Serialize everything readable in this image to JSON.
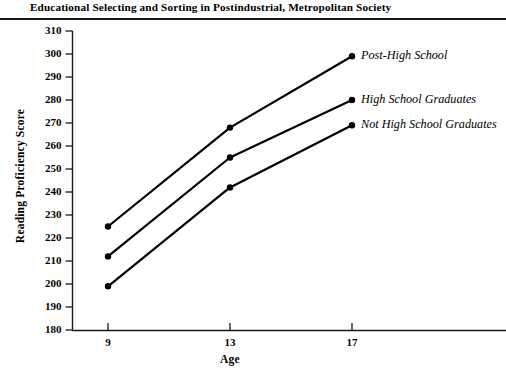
{
  "running_head": {
    "title": "Educational Selecting and Sorting in Postindustrial, Metropolitan Society"
  },
  "chart_data": {
    "type": "line",
    "title": "",
    "xlabel": "Age",
    "ylabel": "Reading Proficiency Score",
    "x": [
      9,
      13,
      17
    ],
    "categories": [
      "9",
      "13",
      "17"
    ],
    "xtick_labels": [
      "9",
      "13",
      "17"
    ],
    "ytick_labels": [
      "310",
      "300",
      "290",
      "280",
      "270",
      "260",
      "250",
      "240",
      "230",
      "220",
      "210",
      "200",
      "190",
      "180"
    ],
    "ylim": [
      180,
      310
    ],
    "ytick_step": 10,
    "xlim": [
      7.5,
      19.5
    ],
    "grid": false,
    "legend_position": "right-inline-labels",
    "line_color": "#000000",
    "marker_color": "#000000",
    "series": [
      {
        "name": "Post-High School",
        "label": "Post-High School",
        "values": [
          225,
          268,
          299
        ]
      },
      {
        "name": "High School Graduates",
        "label": "High School Graduates",
        "values": [
          212,
          255,
          280
        ]
      },
      {
        "name": "Not High School Graduates",
        "label": "Not High School Graduates",
        "values": [
          199,
          242,
          269
        ]
      }
    ]
  }
}
